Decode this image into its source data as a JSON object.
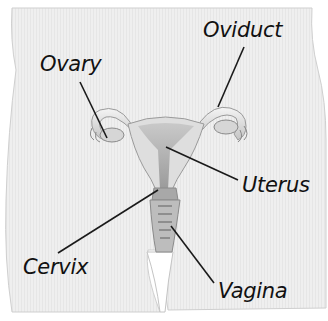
{
  "figure": {
    "labels": [
      {
        "id": "ovary",
        "text": "Ovary",
        "x": 40,
        "y": 54
      },
      {
        "id": "oviduct",
        "text": "Oviduct",
        "x": 203,
        "y": 20
      },
      {
        "id": "uterus",
        "text": "Uterus",
        "x": 242,
        "y": 175
      },
      {
        "id": "cervix",
        "text": "Cervix",
        "x": 23,
        "y": 257
      },
      {
        "id": "vagina",
        "text": "Vagina",
        "x": 218,
        "y": 281
      }
    ],
    "colors": {
      "body_fill": "#eeeeee",
      "body_edge": "#c8c8c8",
      "organ_light": "#e2e2e2",
      "organ_mid": "#b5b5b5",
      "organ_dark": "#7a7a7a",
      "leader_line": "#1a1a1a",
      "text": "#111111"
    }
  }
}
